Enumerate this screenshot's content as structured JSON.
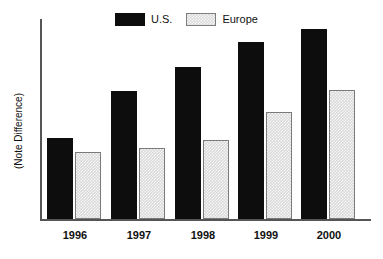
{
  "chart_data": {
    "type": "bar",
    "title": "",
    "xlabel": "",
    "ylabel": "(Note Difference)",
    "categories": [
      "1996",
      "1997",
      "1998",
      "1999",
      "2000"
    ],
    "series": [
      {
        "name": "U.S.",
        "color": "#0d0d0d",
        "values": [
          81,
          128,
          152,
          177,
          190
        ]
      },
      {
        "name": "Europe",
        "color": "#d9d9d9",
        "values": [
          67,
          71,
          79,
          107,
          129
        ]
      }
    ],
    "ylim": [
      0,
      200
    ],
    "y_ticks": [],
    "grid": false,
    "legend_position": "top-center",
    "note": "(Note Difference)"
  },
  "legend": {
    "items": [
      {
        "label": "U.S.",
        "icon": "legend-swatch-solid-black"
      },
      {
        "label": "Europe",
        "icon": "legend-swatch-hatched-gray"
      }
    ]
  },
  "axis": {
    "y_title": "(Note Difference)",
    "x_tick_labels": [
      "1996",
      "1997",
      "1998",
      "1999",
      "2000"
    ]
  },
  "colors": {
    "us_bar": "#0d0d0d",
    "europe_bar": "#d9d9d9",
    "europe_border": "#7a7a7a",
    "axis": "#555555",
    "background": "#ffffff",
    "text": "#111111"
  }
}
